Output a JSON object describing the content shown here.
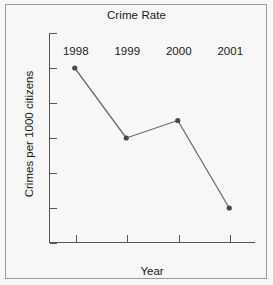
{
  "chart_data": {
    "type": "line",
    "title": "Crime Rate",
    "xlabel": "Year",
    "ylabel": "Crimes per 1000 citizens",
    "categories": [
      "1998",
      "1999",
      "2000",
      "2001"
    ],
    "x": [
      1998,
      1999,
      2000,
      2001
    ],
    "values": [
      28.0,
      26.0,
      26.5,
      24.0
    ],
    "series": [
      {
        "name": "Crime Rate",
        "values": [
          28.0,
          26.0,
          26.5,
          24.0
        ]
      }
    ],
    "ylim": [
      23,
      29
    ],
    "yticks": [
      23,
      24,
      25,
      26,
      27,
      28,
      29
    ],
    "ytick_labels": [
      "23",
      "24",
      "25",
      "26",
      "27",
      "28",
      "29"
    ],
    "xtick_labels": [
      "1998",
      "1999",
      "2000",
      "2001"
    ],
    "grid": false,
    "legend": false,
    "legend_position": "none",
    "marker": "filled-circle",
    "line_color": "#6e6e6e",
    "marker_color": "#4a4a4a",
    "axis_color": "#555555",
    "background_color": "#f7f7f7",
    "text_color": "#1a1a1a"
  }
}
